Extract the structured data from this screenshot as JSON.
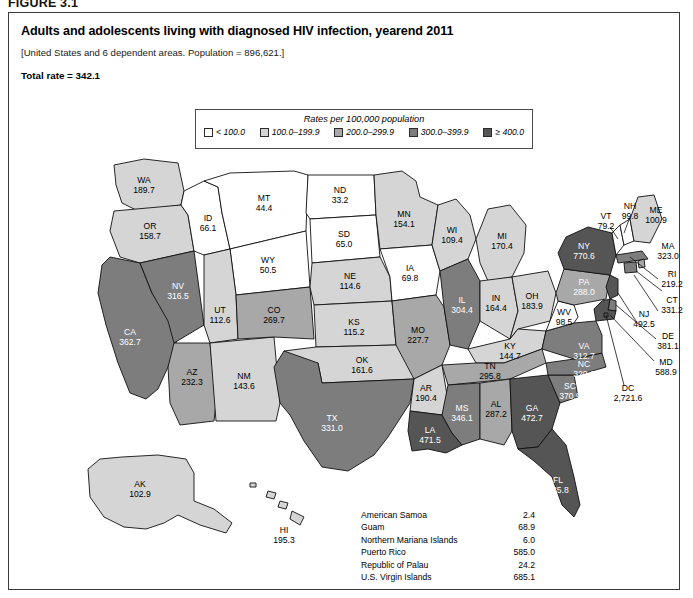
{
  "figure_label": "FIGURE 3.1",
  "title": "Adults and adolescents living with diagnosed HIV infection, yearend 2011",
  "subtitle": "[United States and 6 dependent areas. Population = 896,621.]",
  "total_rate": "Total rate = 342.1",
  "legend": {
    "title": "Rates per 100,000 population",
    "items": [
      {
        "label": "< 100.0",
        "color": "#ffffff"
      },
      {
        "label": "100.0–199.9",
        "color": "#d5d5d5"
      },
      {
        "label": "200.0–299.9",
        "color": "#a8a8a8"
      },
      {
        "label": "300.0–399.9",
        "color": "#7d7d7d"
      },
      {
        "label": "≥ 400.0",
        "color": "#555555"
      }
    ]
  },
  "chart_data": {
    "type": "map",
    "title": "Adults and adolescents living with diagnosed HIV infection, yearend 2011",
    "unit": "Rates per 100,000 population",
    "total_rate": 342.1,
    "population": 896621,
    "bins": [
      {
        "label": "< 100.0",
        "min": 0,
        "max": 99.9,
        "color": "#ffffff"
      },
      {
        "label": "100.0-199.9",
        "min": 100.0,
        "max": 199.9,
        "color": "#d5d5d5"
      },
      {
        "label": "200.0-299.9",
        "min": 200.0,
        "max": 299.9,
        "color": "#a8a8a8"
      },
      {
        "label": "300.0-399.9",
        "min": 300.0,
        "max": 399.9,
        "color": "#7d7d7d"
      },
      {
        "label": ">= 400.0",
        "min": 400.0,
        "max": null,
        "color": "#555555"
      }
    ],
    "states": [
      {
        "code": "WA",
        "rate": 189.7
      },
      {
        "code": "OR",
        "rate": 158.7
      },
      {
        "code": "CA",
        "rate": 362.7
      },
      {
        "code": "NV",
        "rate": 316.5
      },
      {
        "code": "ID",
        "rate": 66.1
      },
      {
        "code": "MT",
        "rate": 44.4
      },
      {
        "code": "WY",
        "rate": 50.5
      },
      {
        "code": "UT",
        "rate": 112.6
      },
      {
        "code": "AZ",
        "rate": 232.3
      },
      {
        "code": "NM",
        "rate": 143.6
      },
      {
        "code": "CO",
        "rate": 269.7
      },
      {
        "code": "ND",
        "rate": 33.2
      },
      {
        "code": "SD",
        "rate": 65.0
      },
      {
        "code": "NE",
        "rate": 114.6
      },
      {
        "code": "KS",
        "rate": 115.2
      },
      {
        "code": "OK",
        "rate": 161.6
      },
      {
        "code": "TX",
        "rate": 331.0
      },
      {
        "code": "MN",
        "rate": 154.1
      },
      {
        "code": "IA",
        "rate": 69.8
      },
      {
        "code": "MO",
        "rate": 227.7
      },
      {
        "code": "AR",
        "rate": 190.4
      },
      {
        "code": "LA",
        "rate": 471.5
      },
      {
        "code": "WI",
        "rate": 109.4
      },
      {
        "code": "IL",
        "rate": 304.4
      },
      {
        "code": "MI",
        "rate": 170.4
      },
      {
        "code": "IN",
        "rate": 164.4
      },
      {
        "code": "OH",
        "rate": 183.9
      },
      {
        "code": "KY",
        "rate": 144.7
      },
      {
        "code": "TN",
        "rate": 295.8
      },
      {
        "code": "MS",
        "rate": 346.1
      },
      {
        "code": "AL",
        "rate": 287.2
      },
      {
        "code": "GA",
        "rate": 472.7
      },
      {
        "code": "FL",
        "rate": 585.8
      },
      {
        "code": "SC",
        "rate": 370.9
      },
      {
        "code": "NC",
        "rate": 320.2
      },
      {
        "code": "VA",
        "rate": 312.7
      },
      {
        "code": "WV",
        "rate": 98.5
      },
      {
        "code": "PA",
        "rate": 288.0
      },
      {
        "code": "NY",
        "rate": 770.6
      },
      {
        "code": "VT",
        "rate": 79.2
      },
      {
        "code": "NH",
        "rate": 99.8
      },
      {
        "code": "ME",
        "rate": 100.9
      },
      {
        "code": "MA",
        "rate": 323.0
      },
      {
        "code": "RI",
        "rate": 219.2
      },
      {
        "code": "CT",
        "rate": 331.2
      },
      {
        "code": "NJ",
        "rate": 492.5
      },
      {
        "code": "DE",
        "rate": 381.1
      },
      {
        "code": "MD",
        "rate": 588.9
      },
      {
        "code": "DC",
        "rate": 2721.6
      },
      {
        "code": "AK",
        "rate": 102.9
      },
      {
        "code": "HI",
        "rate": 195.3
      }
    ],
    "territories": [
      {
        "name": "American Samoa",
        "rate": 2.4
      },
      {
        "name": "Guam",
        "rate": 68.9
      },
      {
        "name": "Northern Mariana Islands",
        "rate": 6.0
      },
      {
        "name": "Puerto Rico",
        "rate": 585.0
      },
      {
        "name": "Republic of Palau",
        "rate": 24.2
      },
      {
        "name": "U.S. Virgin Islands",
        "rate": 685.1
      }
    ]
  },
  "map_labels": {
    "WA": {
      "code": "WA",
      "rate": "189.7"
    },
    "OR": {
      "code": "OR",
      "rate": "158.7"
    },
    "CA": {
      "code": "CA",
      "rate": "362.7"
    },
    "NV": {
      "code": "NV",
      "rate": "316.5"
    },
    "ID": {
      "code": "ID",
      "rate": "66.1"
    },
    "MT": {
      "code": "MT",
      "rate": "44.4"
    },
    "WY": {
      "code": "WY",
      "rate": "50.5"
    },
    "UT": {
      "code": "UT",
      "rate": "112.6"
    },
    "AZ": {
      "code": "AZ",
      "rate": "232.3"
    },
    "NM": {
      "code": "NM",
      "rate": "143.6"
    },
    "CO": {
      "code": "CO",
      "rate": "269.7"
    },
    "ND": {
      "code": "ND",
      "rate": "33.2"
    },
    "SD": {
      "code": "SD",
      "rate": "65.0"
    },
    "NE": {
      "code": "NE",
      "rate": "114.6"
    },
    "KS": {
      "code": "KS",
      "rate": "115.2"
    },
    "OK": {
      "code": "OK",
      "rate": "161.6"
    },
    "TX": {
      "code": "TX",
      "rate": "331.0"
    },
    "MN": {
      "code": "MN",
      "rate": "154.1"
    },
    "IA": {
      "code": "IA",
      "rate": "69.8"
    },
    "MO": {
      "code": "MO",
      "rate": "227.7"
    },
    "AR": {
      "code": "AR",
      "rate": "190.4"
    },
    "LA": {
      "code": "LA",
      "rate": "471.5"
    },
    "WI": {
      "code": "WI",
      "rate": "109.4"
    },
    "IL": {
      "code": "IL",
      "rate": "304.4"
    },
    "MI": {
      "code": "MI",
      "rate": "170.4"
    },
    "IN": {
      "code": "IN",
      "rate": "164.4"
    },
    "OH": {
      "code": "OH",
      "rate": "183.9"
    },
    "KY": {
      "code": "KY",
      "rate": "144.7"
    },
    "TN": {
      "code": "TN",
      "rate": "295.8"
    },
    "MS": {
      "code": "MS",
      "rate": "346.1"
    },
    "AL": {
      "code": "AL",
      "rate": "287.2"
    },
    "GA": {
      "code": "GA",
      "rate": "472.7"
    },
    "FL": {
      "code": "FL",
      "rate": "585.8"
    },
    "SC": {
      "code": "SC",
      "rate": "370.9"
    },
    "NC": {
      "code": "NC",
      "rate": "320.2"
    },
    "VA": {
      "code": "VA",
      "rate": "312.7"
    },
    "WV": {
      "code": "WV",
      "rate": "98.5"
    },
    "PA": {
      "code": "PA",
      "rate": "288.0"
    },
    "NY": {
      "code": "NY",
      "rate": "770.6"
    },
    "VT": {
      "code": "VT",
      "rate": "79.2"
    },
    "NH": {
      "code": "NH",
      "rate": "99.8"
    },
    "ME": {
      "code": "ME",
      "rate": "100.9"
    },
    "MA": {
      "code": "MA",
      "rate": "323.0"
    },
    "RI": {
      "code": "RI",
      "rate": "219.2"
    },
    "CT": {
      "code": "CT",
      "rate": "331.2"
    },
    "NJ": {
      "code": "NJ",
      "rate": "492.5"
    },
    "DE": {
      "code": "DE",
      "rate": "381.1"
    },
    "MD": {
      "code": "MD",
      "rate": "588.9"
    },
    "DC": {
      "code": "DC",
      "rate": "2,721.6"
    },
    "AK": {
      "code": "AK",
      "rate": "102.9"
    },
    "HI": {
      "code": "HI",
      "rate": "195.3"
    }
  },
  "territory_table": [
    {
      "name": "American Samoa",
      "value": "2.4"
    },
    {
      "name": "Guam",
      "value": "68.9"
    },
    {
      "name": "Northern Mariana Islands",
      "value": "6.0"
    },
    {
      "name": "Puerto Rico",
      "value": "585.0"
    },
    {
      "name": "Republic of Palau",
      "value": "24.2"
    },
    {
      "name": "U.S. Virgin Islands",
      "value": "685.1"
    }
  ]
}
